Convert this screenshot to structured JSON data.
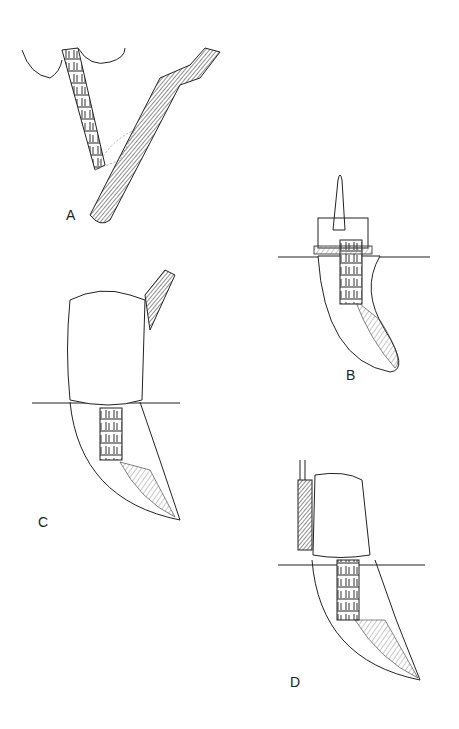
{
  "figure": {
    "panels": [
      {
        "id": "A",
        "label": "A",
        "description": "flat instrument packing material against post with serrations"
      },
      {
        "id": "B",
        "label": "B",
        "description": "tooth root with serrated post and preformed crown form with handle"
      },
      {
        "id": "C",
        "label": "C",
        "description": "core buildup material placed over post, instrument at upper right"
      },
      {
        "id": "D",
        "label": "D",
        "description": "shaped core buildup with instrument along left side"
      }
    ],
    "colors": {
      "line": "#222222",
      "background": "#ffffff",
      "hatch": "#555555"
    }
  }
}
